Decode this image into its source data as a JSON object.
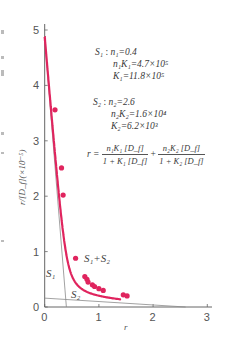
{
  "chart_data": {
    "type": "line",
    "title": "",
    "xlabel": "r",
    "ylabel": "r/[D_f](×10⁻⁵)",
    "xlim": [
      0,
      3
    ],
    "ylim": [
      0,
      5
    ],
    "x_ticks": [
      "0",
      "1",
      "2",
      "3"
    ],
    "y_ticks": [
      "0",
      "1",
      "2",
      "3",
      "4",
      "5"
    ],
    "grid": false,
    "legend": "inline labels",
    "series": [
      {
        "name": "S1+S2",
        "kind": "fitted curve with data points",
        "color": "#e0245e",
        "points": [
          {
            "x": 0.19,
            "y": 3.56
          },
          {
            "x": 0.31,
            "y": 2.51
          },
          {
            "x": 0.34,
            "y": 2.02
          },
          {
            "x": 0.57,
            "y": 0.88
          },
          {
            "x": 0.74,
            "y": 0.55
          },
          {
            "x": 0.78,
            "y": 0.5
          },
          {
            "x": 0.8,
            "y": 0.45
          },
          {
            "x": 0.88,
            "y": 0.4
          },
          {
            "x": 0.92,
            "y": 0.37
          },
          {
            "x": 1.0,
            "y": 0.33
          },
          {
            "x": 1.08,
            "y": 0.3
          },
          {
            "x": 1.45,
            "y": 0.22
          },
          {
            "x": 1.52,
            "y": 0.2
          }
        ]
      },
      {
        "name": "S1",
        "kind": "straight line",
        "color": "#888888",
        "from": {
          "x": 0,
          "y": 4.7
        },
        "to": {
          "x": 0.4,
          "y": 0
        }
      },
      {
        "name": "S2",
        "kind": "straight line",
        "color": "#888888",
        "from": {
          "x": 0,
          "y": 0.16
        },
        "to": {
          "x": 2.6,
          "y": 0
        }
      }
    ],
    "annotations": {
      "S1": {
        "label": "S₁",
        "n1": "n₁=0.4",
        "n1K1": "n₁K₁=4.7×10⁵",
        "K1": "K₁=11.8×10⁵"
      },
      "S2": {
        "label": "S₂",
        "n2": "n₂=2.6",
        "n2K2": "n₂K₂=1.6×10⁴",
        "K2": "K₂=6.2×10³"
      },
      "equation": {
        "lhs": "r =",
        "term1_num": "n₁K₁ [D_f]",
        "term1_den": "1 + K₁ [D_f]",
        "plus": "+",
        "term2_num": "n₂K₂ [D_f]",
        "term2_den": "1 + K₂ [D_f]"
      }
    }
  },
  "labels": {
    "s1_line": "S₁",
    "s2_line": "S₂",
    "sum_curve": "S₁+S₂",
    "origin_y": "0",
    "origin_x": "0"
  },
  "colors": {
    "curve": "#e0245e",
    "component_lines": "#8a8a8a",
    "axes": "#666666"
  }
}
